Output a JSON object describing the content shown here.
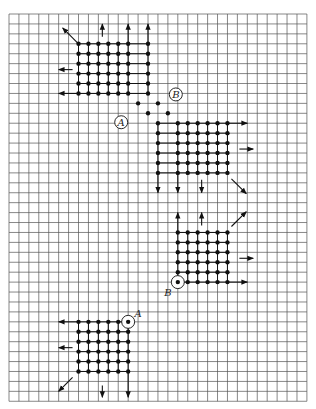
{
  "diagram": {
    "grid": {
      "columns": 30,
      "rows": 39,
      "line_color": "#555555"
    },
    "ink_color": "#111111",
    "clusters": [
      {
        "name": "top-left-cluster",
        "dots": {
          "cols": [
            7,
            8,
            9,
            10,
            11,
            12,
            14
          ],
          "rows": [
            3,
            4,
            5,
            6,
            7,
            8
          ]
        },
        "arrows": [
          {
            "name": "arrow-northwest",
            "from": [
              7,
              3
            ],
            "to": [
              5.4,
              1.4
            ]
          },
          {
            "name": "arrow-up-1",
            "from": [
              9.4,
              2.3
            ],
            "to": [
              9.4,
              1.0
            ]
          },
          {
            "name": "arrow-up-2",
            "from": [
              12,
              3
            ],
            "to": [
              12,
              1.0
            ]
          },
          {
            "name": "arrow-up-3",
            "from": [
              14,
              3
            ],
            "to": [
              14,
              1.0
            ]
          },
          {
            "name": "arrow-left-1",
            "from": [
              6.4,
              5.6
            ],
            "to": [
              5.0,
              5.6
            ]
          },
          {
            "name": "arrow-left-2",
            "from": [
              7,
              8
            ],
            "to": [
              5.0,
              8
            ]
          }
        ]
      },
      {
        "name": "connector-path",
        "points": [
          [
            13,
            9
          ],
          [
            15,
            9
          ],
          [
            14,
            10
          ],
          [
            16,
            10
          ]
        ]
      },
      {
        "name": "mid-right-cluster",
        "dots": {
          "cols": [
            15,
            17,
            18,
            19,
            20,
            21,
            22
          ],
          "rows": [
            11,
            12,
            13,
            14,
            15,
            16
          ]
        },
        "arrows": [
          {
            "name": "arrow-right-1",
            "from": [
              22,
              11
            ],
            "to": [
              24,
              11
            ]
          },
          {
            "name": "arrow-right-2",
            "from": [
              23.2,
              13.6
            ],
            "to": [
              24.6,
              13.6
            ]
          },
          {
            "name": "arrow-southeast",
            "from": [
              22.4,
              16.6
            ],
            "to": [
              23.9,
              18.1
            ]
          },
          {
            "name": "arrow-down-1",
            "from": [
              15,
              16
            ],
            "to": [
              15,
              18
            ]
          },
          {
            "name": "arrow-down-2",
            "from": [
              17,
              16
            ],
            "to": [
              17,
              18
            ]
          },
          {
            "name": "arrow-down-3",
            "from": [
              19.4,
              16.7
            ],
            "to": [
              19.4,
              18
            ]
          }
        ]
      },
      {
        "name": "lower-right-cluster",
        "dots": {
          "cols": [
            17,
            18,
            19,
            20,
            21,
            22
          ],
          "rows": [
            22,
            23,
            24,
            25,
            26,
            27
          ]
        },
        "arrows": [
          {
            "name": "arrow-up-1",
            "from": [
              17,
              22
            ],
            "to": [
              17,
              20
            ]
          },
          {
            "name": "arrow-up-2",
            "from": [
              19.4,
              21.3
            ],
            "to": [
              19.4,
              20
            ]
          },
          {
            "name": "arrow-northeast",
            "from": [
              22.4,
              21.4
            ],
            "to": [
              23.9,
              19.9
            ]
          },
          {
            "name": "arrow-right-1",
            "from": [
              23.2,
              24.6
            ],
            "to": [
              24.6,
              24.6
            ]
          },
          {
            "name": "arrow-right-2",
            "from": [
              22,
              27
            ],
            "to": [
              24,
              27
            ]
          }
        ]
      },
      {
        "name": "lower-left-cluster",
        "dots": {
          "cols": [
            7,
            8,
            9,
            10,
            11,
            12
          ],
          "rows": [
            31,
            32,
            33,
            34,
            35,
            36
          ]
        },
        "arrows": [
          {
            "name": "arrow-left-1",
            "from": [
              7,
              31
            ],
            "to": [
              5,
              31
            ]
          },
          {
            "name": "arrow-left-2",
            "from": [
              6.4,
              33.6
            ],
            "to": [
              5.0,
              33.6
            ]
          },
          {
            "name": "arrow-southwest",
            "from": [
              6.4,
              36.6
            ],
            "to": [
              5.0,
              38.0
            ]
          },
          {
            "name": "arrow-down-1",
            "from": [
              9.4,
              37.4
            ],
            "to": [
              9.4,
              38.6
            ]
          },
          {
            "name": "arrow-down-2",
            "from": [
              12,
              36
            ],
            "to": [
              12,
              38.6
            ]
          }
        ]
      }
    ],
    "markers": [
      {
        "name": "marker-a-upper",
        "label": "A",
        "at": [
          11.3,
          10.9
        ],
        "center_dot": false
      },
      {
        "name": "marker-b-upper",
        "label": "B",
        "at": [
          16.8,
          8.1
        ],
        "center_dot": false
      },
      {
        "name": "marker-b-lower",
        "label": "B",
        "at": [
          17,
          27
        ],
        "center_dot": true,
        "label_offset": [
          -1.0,
          1.0
        ]
      },
      {
        "name": "marker-a-lower",
        "label": "A",
        "at": [
          12,
          31
        ],
        "center_dot": true,
        "label_offset": [
          1.0,
          -0.9
        ]
      }
    ]
  }
}
